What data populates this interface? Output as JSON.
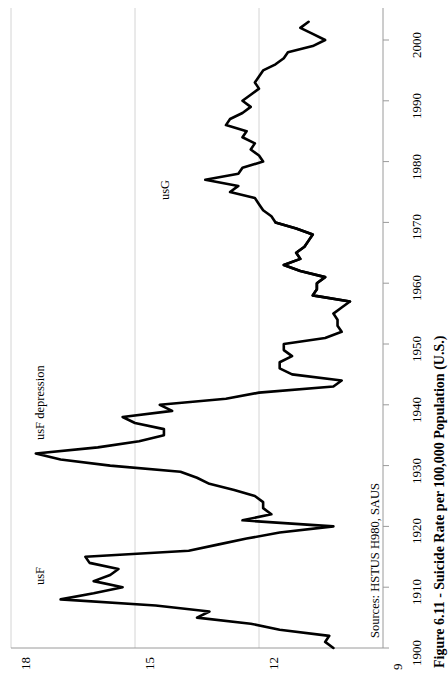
{
  "figure": {
    "caption": "Figure 6.11 - Suicide Rate per 100,000 Population (U.S.)",
    "sources": "Sources: HSTUS H980, SAUS"
  },
  "labels": {
    "usF": "usF",
    "usF_depression": "usF depression",
    "usG": "usG"
  },
  "chart_data": {
    "type": "line",
    "title": "Figure 6.11 - Suicide Rate per 100,000 Population (U.S.)",
    "orientation": "rotated-90ccw",
    "xlabel": "",
    "ylabel": "Suicide Rate per 100,000 Population (U.S.)",
    "xlim": [
      1900,
      2003
    ],
    "ylim": [
      9,
      18
    ],
    "xticks": [
      1900,
      1910,
      1920,
      1930,
      1940,
      1950,
      1960,
      1970,
      1980,
      1990,
      2000
    ],
    "yticks": [
      9,
      12,
      15,
      18
    ],
    "grid": true,
    "legend_position": "inline-annotations",
    "annotations": [
      {
        "text": "usF",
        "x": 1908,
        "y": 17.6
      },
      {
        "text": "usF depression",
        "x": 1932,
        "y": 17.9
      },
      {
        "text": "usG",
        "x": 1975,
        "y": 14.6
      }
    ],
    "series": [
      {
        "name": "usF",
        "x": [
          1900,
          1901,
          1902,
          1903,
          1904,
          1905,
          1906,
          1907,
          1908,
          1909,
          1910,
          1911,
          1912,
          1913,
          1914,
          1915,
          1916,
          1917,
          1918,
          1919,
          1920,
          1921,
          1922,
          1923,
          1924,
          1925,
          1926,
          1927,
          1928,
          1929,
          1930,
          1931,
          1932,
          1933,
          1934,
          1935,
          1936,
          1937,
          1938,
          1939,
          1940,
          1941,
          1942,
          1943,
          1944,
          1945,
          1946,
          1947,
          1948,
          1949,
          1950,
          1951,
          1952,
          1953,
          1954,
          1955,
          1956,
          1957,
          1958,
          1959,
          1960,
          1961,
          1962,
          1963,
          1964,
          1965,
          1966,
          1967,
          1968,
          1969,
          1970
        ],
        "y": [
          10.2,
          10.4,
          10.3,
          11.5,
          12.2,
          13.5,
          13.2,
          14.5,
          16.8,
          16.0,
          15.3,
          16.0,
          15.6,
          15.4,
          16.1,
          16.2,
          13.7,
          13.0,
          12.3,
          11.5,
          10.2,
          12.4,
          11.7,
          11.9,
          11.9,
          12.1,
          12.6,
          13.2,
          13.5,
          13.9,
          15.6,
          16.8,
          17.4,
          15.9,
          14.9,
          14.3,
          14.3,
          15.0,
          15.3,
          14.1,
          14.4,
          12.8,
          12.0,
          10.2,
          10.0,
          11.2,
          11.5,
          11.5,
          11.2,
          11.4,
          11.4,
          10.4,
          10.0,
          10.1,
          10.1,
          10.2,
          10.0,
          9.8,
          10.7,
          10.6,
          10.6,
          10.4,
          11.0,
          11.4,
          11.0,
          11.1,
          10.9,
          10.8,
          10.7,
          11.1,
          11.6
        ]
      },
      {
        "name": "usG",
        "x": [
          1957,
          1958,
          1959,
          1960,
          1961,
          1962,
          1963,
          1964,
          1965,
          1966,
          1967,
          1968,
          1969,
          1970,
          1971,
          1972,
          1973,
          1974,
          1975,
          1976,
          1977,
          1978,
          1979,
          1980,
          1981,
          1982,
          1983,
          1984,
          1985,
          1986,
          1987,
          1988,
          1989,
          1990,
          1991,
          1992,
          1993,
          1994,
          1995,
          1996,
          1997,
          1998,
          1999,
          2000,
          2001,
          2002,
          2003
        ],
        "y": [
          9.8,
          10.7,
          10.6,
          10.6,
          10.4,
          11.0,
          11.4,
          11.0,
          11.1,
          10.9,
          10.8,
          10.7,
          11.1,
          11.6,
          11.7,
          11.9,
          12.0,
          12.1,
          12.7,
          12.5,
          13.3,
          12.5,
          12.4,
          11.9,
          12.0,
          12.2,
          12.1,
          12.4,
          12.3,
          12.8,
          12.7,
          12.4,
          12.2,
          12.4,
          12.2,
          12.0,
          12.1,
          12.0,
          11.9,
          11.6,
          11.4,
          11.3,
          10.7,
          10.4,
          10.7,
          11.0,
          10.8
        ]
      }
    ]
  }
}
